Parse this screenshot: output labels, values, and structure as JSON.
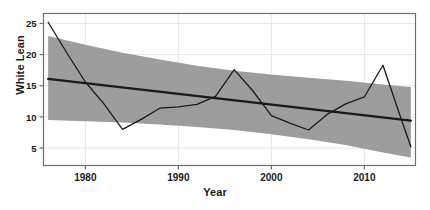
{
  "chart_data": {
    "type": "line",
    "title": "",
    "xlabel": "Year",
    "ylabel": "White Lean",
    "xlim": [
      1975.5,
      2015.5
    ],
    "ylim": [
      2.2,
      26.6
    ],
    "xticks": [
      1980,
      1990,
      2000,
      2010
    ],
    "xtick_labels": [
      "1980",
      "1990",
      "2000",
      "2010"
    ],
    "yticks": [
      5,
      10,
      15,
      20,
      25
    ],
    "ytick_labels": [
      "5",
      "10",
      "15",
      "20",
      "25"
    ],
    "grid": true,
    "legend": "none",
    "series": [
      {
        "name": "observed",
        "role": "data-line",
        "color": "#1a1a1a",
        "x": [
          1976,
          1978,
          1980,
          1982,
          1984,
          1986,
          1988,
          1990,
          1992,
          1994,
          1996,
          1998,
          2000,
          2002,
          2004,
          2006,
          2008,
          2010,
          2012,
          2014,
          2015
        ],
        "y": [
          25.2,
          20.3,
          15.6,
          12.1,
          8.0,
          9.6,
          11.4,
          11.6,
          12.0,
          13.3,
          17.6,
          14.2,
          10.2,
          9.0,
          7.9,
          10.4,
          12.1,
          13.2,
          18.3,
          9.5,
          5.2
        ]
      },
      {
        "name": "fitted trend",
        "role": "trend-line",
        "color": "#1a1a1a",
        "x": [
          1976,
          2015
        ],
        "y": [
          16.1,
          9.4
        ]
      }
    ],
    "bands": [
      {
        "name": "confidence band",
        "color": "#9d9d9d",
        "x": [
          1976,
          1980,
          1984,
          1988,
          1992,
          1996,
          2000,
          2004,
          2008,
          2012,
          2015
        ],
        "upper": [
          23.0,
          21.6,
          20.3,
          19.2,
          18.2,
          17.4,
          16.8,
          16.3,
          15.8,
          15.2,
          14.8
        ],
        "lower": [
          9.5,
          9.3,
          9.1,
          8.8,
          8.4,
          7.9,
          7.2,
          6.4,
          5.5,
          4.3,
          3.5
        ]
      }
    ]
  },
  "style": {
    "frame_color": "#6e6e6e",
    "grid_color": "#e6e6e6",
    "tick_color": "#6e6e6e",
    "tick_text_color": "#1a1a1a",
    "plot_bg": "#ffffff"
  }
}
